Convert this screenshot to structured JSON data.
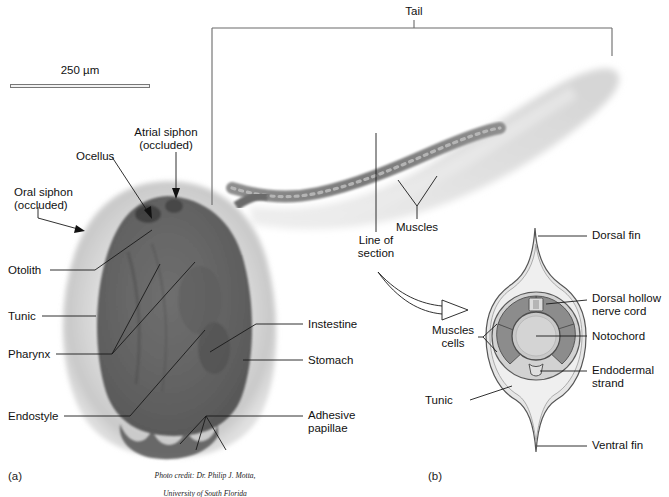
{
  "figure": {
    "title_region": "Tadpole larva of a tunicate (ascidian) with tail cross-section",
    "background_color": "#ffffff",
    "ink_color": "#1a1a1a",
    "bracket_color": "#6b6b6b"
  },
  "scalebar": {
    "label": "250 µm",
    "x": 10,
    "y": 84,
    "width": 140
  },
  "panels": [
    {
      "id": "a",
      "label": "(a)",
      "x": 8,
      "y": 470
    },
    {
      "id": "b",
      "label": "(b)",
      "x": 428,
      "y": 470
    }
  ],
  "bracket": {
    "label": "Tail",
    "label_x": 414,
    "label_y": 6
  },
  "credit": {
    "line1": "Photo credit: Dr. Philip J. Motta,",
    "line2": "University of South Florida",
    "x": 205,
    "y": 462
  },
  "panel_a": {
    "name": "larva-photograph",
    "labels": [
      {
        "name": "atrial-siphon",
        "text": "Atrial siphon\n(occluded)",
        "x": 148,
        "y": 126,
        "align": "center"
      },
      {
        "name": "ocellus",
        "text": "Ocellus",
        "x": 76,
        "y": 150,
        "align": "left"
      },
      {
        "name": "oral-siphon",
        "text": "Oral siphon\n(occluded)",
        "x": 14,
        "y": 186,
        "align": "left"
      },
      {
        "name": "otolith",
        "text": "Otolith",
        "x": 8,
        "y": 265,
        "align": "left"
      },
      {
        "name": "tunic",
        "text": "Tunic",
        "x": 8,
        "y": 310,
        "align": "left"
      },
      {
        "name": "pharynx",
        "text": "Pharynx",
        "x": 8,
        "y": 348,
        "align": "left"
      },
      {
        "name": "endostyle",
        "text": "Endostyle",
        "x": 8,
        "y": 410,
        "align": "left"
      },
      {
        "name": "intestine",
        "text": "Instestine",
        "x": 308,
        "y": 319,
        "align": "left"
      },
      {
        "name": "stomach",
        "text": "Stomach",
        "x": 308,
        "y": 355,
        "align": "left"
      },
      {
        "name": "adhesive-papillae",
        "text": "Adhesive\npapillae",
        "x": 308,
        "y": 410,
        "align": "left"
      },
      {
        "name": "muscles-tail",
        "text": "Muscles",
        "x": 417,
        "y": 224,
        "align": "center"
      },
      {
        "name": "line-of-section",
        "text": "Line of\nsection",
        "x": 365,
        "y": 235,
        "align": "center"
      }
    ]
  },
  "panel_b": {
    "name": "tail-cross-section-diagram",
    "labels": [
      {
        "name": "dorsal-fin",
        "text": "Dorsal fin",
        "x": 592,
        "y": 230,
        "align": "left"
      },
      {
        "name": "dorsal-hollow-nerve-cord",
        "text": "Dorsal hollow\nnerve cord",
        "x": 592,
        "y": 293,
        "align": "left"
      },
      {
        "name": "notochord",
        "text": "Notochord",
        "x": 592,
        "y": 331,
        "align": "left"
      },
      {
        "name": "endodermal-strand",
        "text": "Endodermal\nstrand",
        "x": 592,
        "y": 365,
        "align": "left"
      },
      {
        "name": "ventral-fin",
        "text": "Ventral fin",
        "x": 592,
        "y": 440,
        "align": "left"
      },
      {
        "name": "muscle-cells",
        "text": "Muscles\ncells",
        "x": 433,
        "y": 331,
        "align": "left"
      },
      {
        "name": "tunic-section",
        "text": "Tunic",
        "x": 433,
        "y": 395,
        "align": "left"
      }
    ],
    "colors": {
      "tunic": "#e3e3e3",
      "epidermis": "#cfcfcf",
      "muscle": "#8c8c8c",
      "notochord": "#c9c9c9",
      "nerve_cord": "#d8d8d8",
      "endodermal_strand": "#d8d8d8",
      "outline": "#4d4d4d"
    }
  }
}
